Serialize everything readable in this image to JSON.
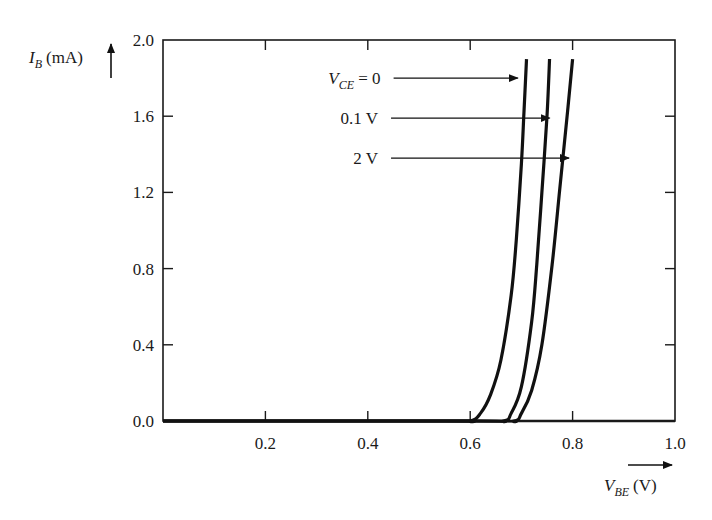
{
  "chart_data": {
    "type": "line",
    "title": "",
    "xlabel": {
      "symbol": "V",
      "subscript": "BE",
      "unit": "(V)"
    },
    "ylabel": {
      "symbol": "I",
      "subscript": "B",
      "unit": "(mA)"
    },
    "xlim": [
      0.0,
      1.0
    ],
    "ylim": [
      0.0,
      2.0
    ],
    "x_ticks": [
      0.2,
      0.4,
      0.6,
      0.8,
      1.0
    ],
    "x_tick_labels": [
      "0.2",
      "0.4",
      "0.6",
      "0.8",
      "1.0"
    ],
    "y_ticks": [
      0.0,
      0.4,
      0.8,
      1.2,
      1.6,
      2.0
    ],
    "y_tick_labels": [
      "0.0",
      "0.4",
      "0.8",
      "1.2",
      "1.6",
      "2.0"
    ],
    "grid": false,
    "legend": "inline annotations with arrows",
    "series": [
      {
        "name": "V_CE = 0",
        "label_main": "V",
        "label_sub": "CE",
        "label_rest": " = 0",
        "x": [
          0.0,
          0.55,
          0.6,
          0.62,
          0.64,
          0.66,
          0.68,
          0.69,
          0.7,
          0.705,
          0.71
        ],
        "y": [
          0.0,
          0.0,
          0.0,
          0.04,
          0.14,
          0.32,
          0.66,
          0.95,
          1.35,
          1.62,
          1.9
        ]
      },
      {
        "name": "0.1 V",
        "label_main": "0.1 V",
        "label_sub": "",
        "label_rest": "",
        "x": [
          0.0,
          0.6,
          0.665,
          0.68,
          0.7,
          0.72,
          0.73,
          0.74,
          0.75,
          0.755
        ],
        "y": [
          0.0,
          0.0,
          0.0,
          0.04,
          0.18,
          0.52,
          0.82,
          1.2,
          1.6,
          1.9
        ]
      },
      {
        "name": "2 V",
        "label_main": "2 V",
        "label_sub": "",
        "label_rest": "",
        "x": [
          0.0,
          0.62,
          0.685,
          0.7,
          0.72,
          0.74,
          0.76,
          0.775,
          0.79,
          0.8
        ],
        "y": [
          0.0,
          0.0,
          0.0,
          0.04,
          0.16,
          0.4,
          0.82,
          1.22,
          1.62,
          1.9
        ]
      }
    ],
    "annotations": [
      {
        "series": 0,
        "text_x": 0.425,
        "text_y": 1.8,
        "arrow_to_x": 0.693,
        "arrow_to_y": 1.8
      },
      {
        "series": 1,
        "text_x": 0.42,
        "text_y": 1.59,
        "arrow_to_x": 0.755,
        "arrow_to_y": 1.59
      },
      {
        "series": 2,
        "text_x": 0.42,
        "text_y": 1.38,
        "arrow_to_x": 0.793,
        "arrow_to_y": 1.38
      }
    ]
  },
  "colors": {
    "line": "#111111",
    "axis": "#1a1a1a",
    "background": "#ffffff"
  }
}
